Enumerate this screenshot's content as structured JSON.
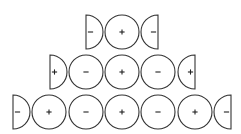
{
  "diagram": {
    "stroke_color": "#333333",
    "radius": 17,
    "rows": [
      {
        "y": 32,
        "items": [
          {
            "type": "half-left",
            "x": 86,
            "sign": "-"
          },
          {
            "type": "full",
            "x": 122,
            "sign": "+"
          },
          {
            "type": "half-right",
            "x": 158,
            "sign": "-"
          }
        ]
      },
      {
        "y": 72,
        "items": [
          {
            "type": "half-left",
            "x": 50,
            "sign": "+"
          },
          {
            "type": "full",
            "x": 86,
            "sign": "-"
          },
          {
            "type": "full",
            "x": 122,
            "sign": "+"
          },
          {
            "type": "full",
            "x": 158,
            "sign": "-"
          },
          {
            "type": "half-right",
            "x": 195,
            "sign": "+"
          }
        ]
      },
      {
        "y": 112,
        "items": [
          {
            "type": "half-left",
            "x": 13,
            "sign": "-"
          },
          {
            "type": "full",
            "x": 49,
            "sign": "+"
          },
          {
            "type": "full",
            "x": 86,
            "sign": "-"
          },
          {
            "type": "full",
            "x": 122,
            "sign": "+"
          },
          {
            "type": "full",
            "x": 158,
            "sign": "-"
          },
          {
            "type": "full",
            "x": 195,
            "sign": "+"
          },
          {
            "type": "half-right",
            "x": 231,
            "sign": "-"
          }
        ]
      }
    ]
  }
}
